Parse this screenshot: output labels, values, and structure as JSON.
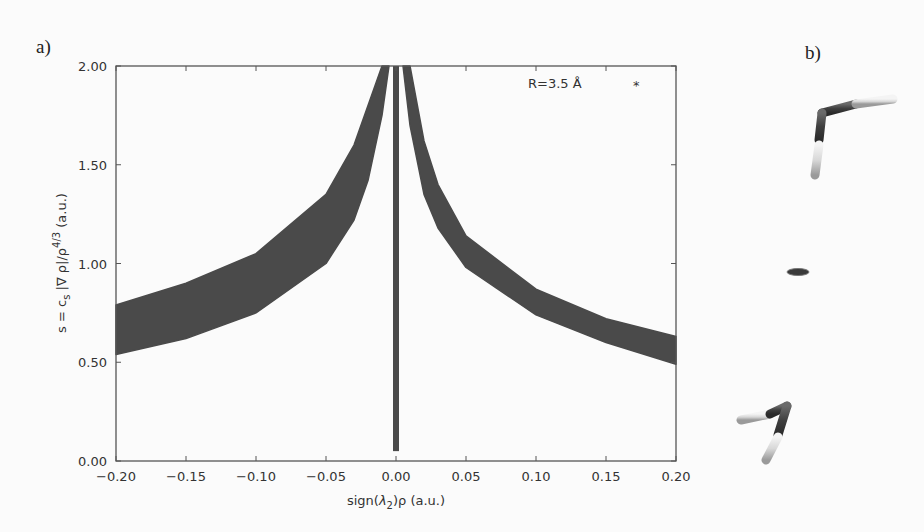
{
  "panels": {
    "a_label": "a)",
    "b_label": "b)"
  },
  "chart_data": {
    "type": "scatter",
    "title": "",
    "annotation": "R=3.5 Å",
    "annotation_marker": "*",
    "xlabel": "sign(λ2)ρ (a.u.)",
    "ylabel": "s = cs |∇ ρ|/ρ^4/3 (a.u.)",
    "xlim": [
      -0.2,
      0.2
    ],
    "ylim": [
      0.0,
      2.0
    ],
    "xticks": [
      "-0.20",
      "-0.15",
      "-0.10",
      "-0.05",
      "0.00",
      "0.05",
      "0.10",
      "0.15",
      "0.20"
    ],
    "yticks": [
      "0.00",
      "0.50",
      "1.00",
      "1.50",
      "2.00"
    ],
    "grid": false,
    "color": "#4a4a4a",
    "series": [
      {
        "name": "left branch (sign<0)",
        "x": [
          -0.2,
          -0.15,
          -0.1,
          -0.05,
          -0.03,
          -0.02,
          -0.01,
          -0.005
        ],
        "y_lower": [
          0.54,
          0.62,
          0.75,
          1.0,
          1.22,
          1.42,
          1.75,
          2.0
        ],
        "y_upper": [
          0.79,
          0.9,
          1.05,
          1.35,
          1.6,
          1.8,
          2.0,
          2.0
        ]
      },
      {
        "name": "central spike",
        "x": [
          0.0,
          0.0
        ],
        "y_lower": [
          0.05
        ],
        "y_upper": [
          2.0
        ]
      },
      {
        "name": "right branch (sign>0)",
        "x": [
          0.005,
          0.01,
          0.02,
          0.03,
          0.05,
          0.1,
          0.15,
          0.2
        ],
        "y_lower": [
          2.0,
          1.7,
          1.35,
          1.18,
          0.98,
          0.74,
          0.6,
          0.49
        ],
        "y_upper": [
          2.0,
          2.0,
          1.62,
          1.4,
          1.14,
          0.87,
          0.72,
          0.63
        ]
      }
    ]
  },
  "molecule_view": {
    "description": "water dimer stick model with NCI isosurface disc between molecules"
  }
}
